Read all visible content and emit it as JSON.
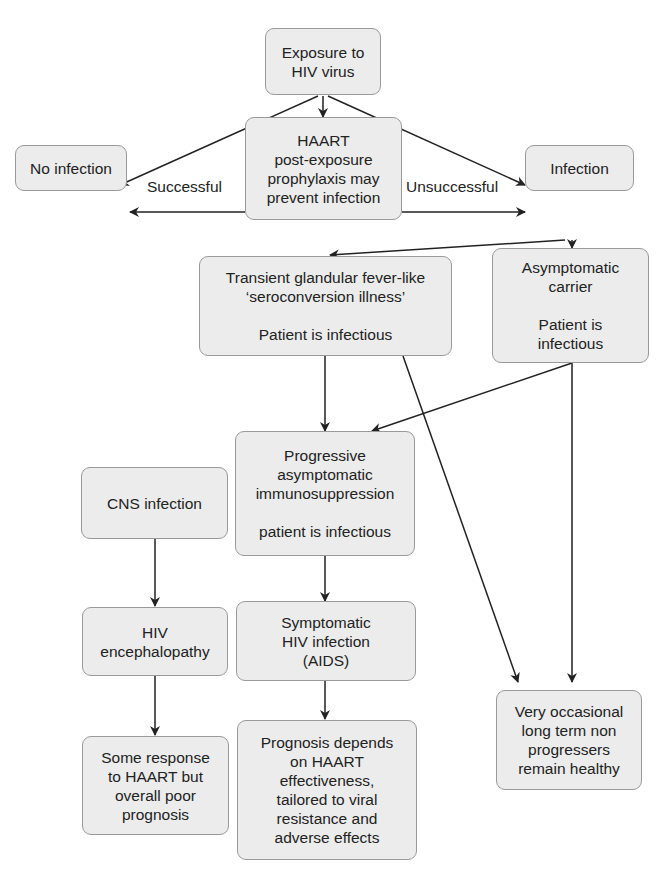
{
  "nodes": {
    "exposure": "Exposure to\nHIV virus",
    "haart": "HAART\npost-exposure\nprophylaxis may\nprevent infection",
    "no_infection": "No infection",
    "infection": "Infection",
    "seroconversion": "Transient glandular fever-like\n‘seroconversion illness’\n\nPatient is infectious",
    "carrier": "Asymptomatic\ncarrier\n\nPatient is\ninfectious",
    "progressive": "Progressive\nasymptomatic\nimmunosuppression\n\npatient is infectious",
    "cns": "CNS infection",
    "encephalopathy": "HIV\nencephalopathy",
    "poor_prognosis": "Some response\nto HAART but\noverall poor\nprognosis",
    "aids": "Symptomatic\nHIV infection\n(AIDS)",
    "prognosis": "Prognosis depends\non HAART\neffectiveness,\ntailored to viral\nresistance and\nadverse effects",
    "non_progressors": "Very occasional\nlong term non\nprogressers\nremain healthy"
  },
  "edge_labels": {
    "successful": "Successful",
    "unsuccessful": "Unsuccessful"
  },
  "colors": {
    "box_fill": "#ececec",
    "box_border": "#9a9a9a",
    "line": "#222222"
  }
}
